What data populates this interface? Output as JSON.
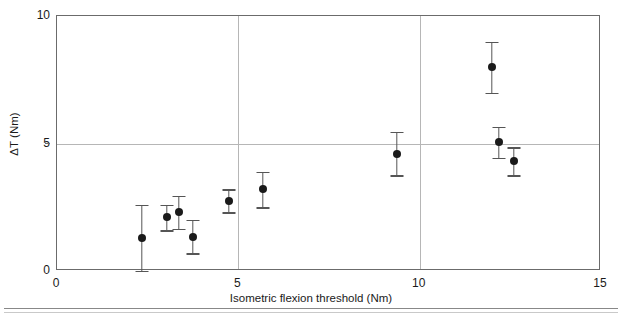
{
  "figure": {
    "background_color": "#ffffff",
    "frame_color": "#6b6b6b",
    "grid_color": "#b6b6b6",
    "marker_color": "#1a1a1a",
    "errorbar_color": "#555555",
    "rule_color": "#888888"
  },
  "chart_data": {
    "type": "scatter",
    "title": "",
    "xlabel": "Isometric flexion threshold (Nm)",
    "ylabel": "ΔT (Nm)",
    "xlim": [
      0,
      15
    ],
    "ylim": [
      0,
      10
    ],
    "xticks": [
      0,
      5,
      10,
      15
    ],
    "xticklabels": [
      "0",
      "5",
      "10",
      "15"
    ],
    "yticks": [
      0,
      5,
      10
    ],
    "yticklabels": [
      "0",
      "5",
      "10"
    ],
    "grid": "vertical gridlines at x=5 and x=10; horizontal gridline at y=5",
    "legend": "none",
    "errorbars": "symmetric vertical, with horizontal caps",
    "points": [
      {
        "x": 2.34,
        "y": 1.3,
        "yerr": 1.3
      },
      {
        "x": 3.03,
        "y": 2.1,
        "yerr": 0.5
      },
      {
        "x": 3.36,
        "y": 2.3,
        "yerr": 0.65
      },
      {
        "x": 3.75,
        "y": 1.35,
        "yerr": 0.65
      },
      {
        "x": 4.74,
        "y": 2.75,
        "yerr": 0.45
      },
      {
        "x": 5.68,
        "y": 3.2,
        "yerr": 0.7
      },
      {
        "x": 9.37,
        "y": 4.6,
        "yerr": 0.85
      },
      {
        "x": 11.99,
        "y": 8.0,
        "yerr": 1.0
      },
      {
        "x": 12.18,
        "y": 5.05,
        "yerr": 0.6
      },
      {
        "x": 12.6,
        "y": 4.3,
        "yerr": 0.55
      }
    ]
  },
  "caption": {
    "sliver_text": ""
  }
}
